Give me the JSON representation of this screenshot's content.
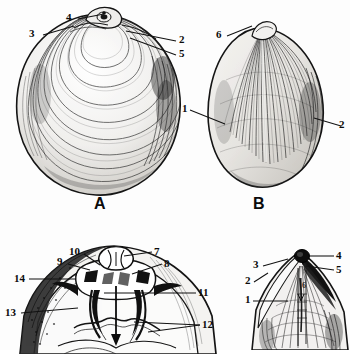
{
  "plate": {
    "background_color": "#fdfdfd",
    "ink_color": "#111111",
    "subject": "bivalve-shell-anatomy-plate",
    "panels": [
      {
        "id": "A",
        "caption": "A",
        "view": "exterior-left-valve-concentric-growth-lines",
        "callouts": [
          "4",
          "3",
          "2",
          "5"
        ]
      },
      {
        "id": "B",
        "caption": "B",
        "view": "exterior-valve-radial-striations",
        "callouts": [
          "6",
          "1",
          "2"
        ]
      },
      {
        "id": "C",
        "caption": "",
        "view": "interior-hinge-detail",
        "callouts": [
          "10",
          "9",
          "7",
          "8",
          "14",
          "11",
          "13",
          "12"
        ]
      },
      {
        "id": "D",
        "caption": "",
        "view": "umbo-beak-detail",
        "callouts": [
          "3",
          "4",
          "5",
          "2",
          "1",
          "6"
        ]
      }
    ]
  },
  "captions": {
    "figure_a": "A",
    "figure_b": "B"
  },
  "callouts": {
    "a4": "4",
    "a3": "3",
    "a2": "2",
    "a5": "5",
    "b6": "6",
    "b1": "1",
    "b2": "2",
    "c10": "10",
    "c9": "9",
    "c7": "7",
    "c8": "8",
    "c14": "14",
    "c11": "11",
    "c13": "13",
    "c12": "12",
    "d3": "3",
    "d4": "4",
    "d5": "5",
    "d2": "2",
    "d1": "1",
    "d6": "6"
  }
}
